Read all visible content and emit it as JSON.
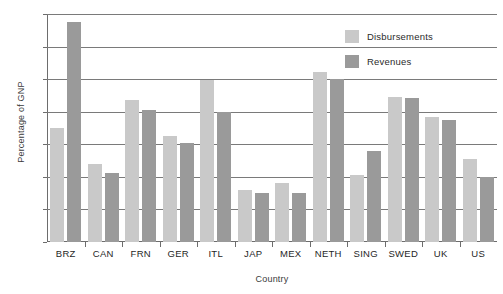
{
  "chart_data": {
    "type": "bar",
    "title": "",
    "xlabel": "Country",
    "ylabel": "Percentage of GNP",
    "ylim": [
      0,
      70
    ],
    "yticks": [
      0,
      10,
      20,
      30,
      40,
      50,
      60,
      70
    ],
    "grid": true,
    "legend_position": "top-right",
    "categories": [
      "BRZ",
      "CAN",
      "FRN",
      "GER",
      "ITL",
      "JAP",
      "MEX",
      "NETH",
      "SING",
      "SWED",
      "UK",
      "US"
    ],
    "series": [
      {
        "name": "Disbursements",
        "color": "#c9c9c9",
        "values": [
          35.0,
          23.8,
          43.7,
          32.7,
          49.7,
          16.0,
          18.0,
          52.3,
          20.6,
          44.5,
          38.3,
          25.5
        ]
      },
      {
        "name": "Revenues",
        "color": "#9a9a9a",
        "values": [
          67.5,
          21.3,
          40.5,
          30.5,
          40.0,
          15.0,
          15.0,
          50.0,
          28.0,
          44.3,
          37.5,
          20.0
        ]
      }
    ]
  },
  "axis": {
    "y_title": "Percentage of GNP",
    "x_title": "Country",
    "y_tick_labels": [
      "0",
      "10",
      "20",
      "30",
      "40",
      "50",
      "60",
      "70"
    ]
  },
  "legend": {
    "items": [
      {
        "label": "Disbursements",
        "color": "#c9c9c9"
      },
      {
        "label": "Revenues",
        "color": "#9a9a9a"
      }
    ]
  },
  "style": {
    "grid_color": "#7a7a7a",
    "axis_color": "#6d6d6d",
    "text_color": "#1f1f1f",
    "background": "#ffffff"
  }
}
